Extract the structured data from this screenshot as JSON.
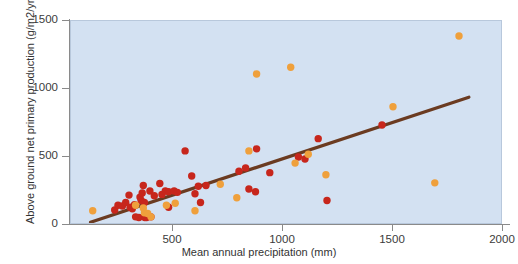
{
  "chart_data": {
    "type": "scatter",
    "title": "",
    "xlabel": "Mean annual precipitation (mm)",
    "ylabel": "Above ground net primary production (g/m2/yr)",
    "xlim": [
      0,
      2000
    ],
    "ylim": [
      0,
      1500
    ],
    "xticks": [
      500,
      1000,
      1500,
      2000
    ],
    "yticks": [
      0,
      500,
      1000,
      1500
    ],
    "grid": false,
    "legend": "none",
    "plot_background_color": "#d3e1f2",
    "series": [
      {
        "name": "red-points",
        "color": "#c7261c",
        "points": [
          [
            235,
            110
          ],
          [
            250,
            145
          ],
          [
            270,
            140
          ],
          [
            285,
            165
          ],
          [
            300,
            220
          ],
          [
            305,
            130
          ],
          [
            315,
            120
          ],
          [
            325,
            150
          ],
          [
            330,
            60
          ],
          [
            345,
            55
          ],
          [
            350,
            205
          ],
          [
            355,
            180
          ],
          [
            360,
            235
          ],
          [
            365,
            290
          ],
          [
            370,
            165
          ],
          [
            372,
            55
          ],
          [
            380,
            55
          ],
          [
            395,
            250
          ],
          [
            400,
            60
          ],
          [
            415,
            215
          ],
          [
            440,
            305
          ],
          [
            450,
            225
          ],
          [
            465,
            250
          ],
          [
            480,
            245
          ],
          [
            480,
            130
          ],
          [
            505,
            250
          ],
          [
            520,
            240
          ],
          [
            555,
            545
          ],
          [
            585,
            360
          ],
          [
            600,
            230
          ],
          [
            615,
            285
          ],
          [
            625,
            165
          ],
          [
            650,
            290
          ],
          [
            800,
            395
          ],
          [
            830,
            420
          ],
          [
            845,
            265
          ],
          [
            875,
            245
          ],
          [
            880,
            560
          ],
          [
            940,
            385
          ],
          [
            1070,
            500
          ],
          [
            1100,
            485
          ],
          [
            1160,
            635
          ],
          [
            1200,
            180
          ],
          [
            1450,
            735
          ]
        ]
      },
      {
        "name": "orange-points",
        "color": "#efa03c",
        "points": [
          [
            135,
            105
          ],
          [
            330,
            145
          ],
          [
            365,
            125
          ],
          [
            370,
            90
          ],
          [
            385,
            85
          ],
          [
            400,
            60
          ],
          [
            470,
            145
          ],
          [
            510,
            160
          ],
          [
            600,
            105
          ],
          [
            715,
            300
          ],
          [
            790,
            200
          ],
          [
            845,
            545
          ],
          [
            880,
            1110
          ],
          [
            1035,
            1160
          ],
          [
            1055,
            455
          ],
          [
            1115,
            520
          ],
          [
            1195,
            370
          ],
          [
            1500,
            870
          ],
          [
            1690,
            310
          ],
          [
            1800,
            1390
          ]
        ]
      }
    ],
    "trendline": {
      "name": "regression-line",
      "color": "#6b3b21",
      "x_start": 125,
      "y_start": 20,
      "x_end": 1845,
      "y_end": 940
    }
  },
  "axes": {
    "y_tick_labels": [
      "1500",
      "1000",
      "500",
      "0"
    ],
    "x_tick_labels": [
      "500",
      "1000",
      "1500",
      "2000"
    ],
    "y_title": "Above ground net primary production (g/m2/yr)",
    "x_title": "Mean annual precipitation (mm)"
  }
}
